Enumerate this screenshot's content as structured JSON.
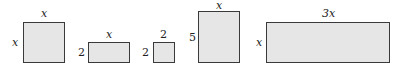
{
  "diagram": {
    "shapes": [
      {
        "name": "square-x-by-x",
        "top_label": "x",
        "side_label": "x"
      },
      {
        "name": "rect-x-by-2",
        "top_label": "x",
        "side_label": "2"
      },
      {
        "name": "square-2-by-2",
        "top_label": "2",
        "side_label": "2"
      },
      {
        "name": "rect-x-by-5",
        "top_label": "x",
        "side_label": "5"
      },
      {
        "name": "rect-3x-by-x",
        "top_label": "3x",
        "side_label": "x"
      }
    ],
    "fill_color": "#e6e6e6",
    "stroke_color": "#3a3a3a"
  }
}
